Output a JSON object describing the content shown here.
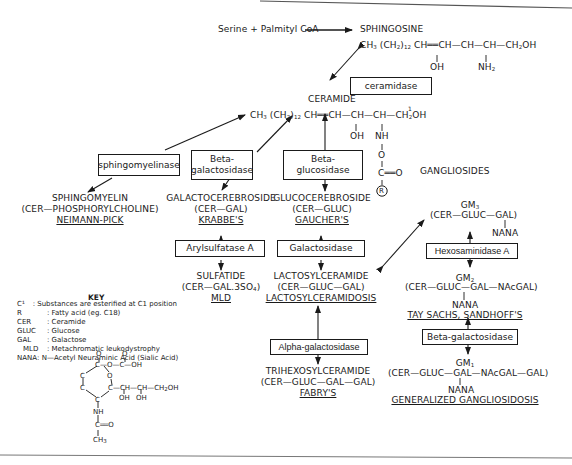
{
  "top": {
    "precursor": "Serine + Palmityl CoA",
    "sphingosine": "SPHINGOSINE",
    "sphingosine_formula": "CH₃ (CH₂)₁₂ CH══CH—CH—CH—CH₂OH",
    "sphingosine_oh": "OH",
    "sphingosine_nh2": "NH₂"
  },
  "ceramide": {
    "label": "CERAMIDE",
    "formula": "CH₃ (CH₂)₁₂ CH══CH—CH—CH—CH₂OH",
    "oh": "OH",
    "nh": "NH",
    "o": "O",
    "co": "C══O",
    "r": "R",
    "c1_mark": "1"
  },
  "enzymes": {
    "ceramidase": "ceramidase",
    "sphingomyelinase": "sphingomyelinase",
    "beta_galactosidase_1": "Beta-\ngalactosidase",
    "beta_glucosidase": "Beta-\nglucosidase",
    "arylsulfatase": "Arylsulfatase A",
    "galactosidase": "Galactosidase",
    "alpha_galactosidase": "Alpha-galactosidase",
    "hexosaminidase": "Hexosaminidase A",
    "beta_galactosidase_2": "Beta-galactosidase"
  },
  "compounds": {
    "sphingomyelin": {
      "name": "SPHINGOMYELIN",
      "formula": "(CER—PHOSPHORYLCHOLINE)",
      "disease": "NEIMANN-PICK"
    },
    "galactocerebroside": {
      "name": "GALACTOCEREBROSIDE",
      "formula": "(CER—GAL)",
      "disease": "KRABBE'S"
    },
    "glucocerebroside": {
      "name": "GLUCOCEREBROSIDE",
      "formula": "(CER—GLUC)",
      "disease": "GAUCHER'S"
    },
    "sulfatide": {
      "name": "SULFATIDE",
      "formula": "(CER—GAL.3SO₄)",
      "disease": "MLD"
    },
    "lactosylceramide": {
      "name": "LACTOSYLCERAMIDE",
      "formula": "(CER—GLUC—GAL)",
      "disease": "LACTOSYLCERAMIDOSIS"
    },
    "trihexosylceramide": {
      "name": "TRIHEXOSYLCERAMIDE",
      "formula": "(CER—GLUC—GAL—GAL)",
      "disease": "FABRY'S"
    }
  },
  "gangliosides": {
    "heading": "GANGLIOSIDES",
    "gm3": {
      "name": "GM₃",
      "formula": "(CER—GLUC—GAL)",
      "nana": "NANA"
    },
    "gm2": {
      "name": "GM₂",
      "formula": "(CER—GLUC—GAL—NAcGAL)",
      "nana": "NANA",
      "disease": "TAY SACHS, SANDHOFF'S"
    },
    "gm1": {
      "name": "GM₁",
      "formula": "(CER—GLUC—GAL—NAcGAL—GAL)",
      "nana": "NANA",
      "disease": "GENERALIZED GANGLIOSIDOSIS"
    }
  },
  "key": {
    "title": "KEY",
    "entries": [
      {
        "abbr": "C¹",
        "desc": ": Substances are esterified at C1 position"
      },
      {
        "abbr": "R",
        "desc": ": Fatty acid (eg. C18)"
      },
      {
        "abbr": "CER",
        "desc": ": Ceramide"
      },
      {
        "abbr": "GLUC",
        "desc": ": Glucose"
      },
      {
        "abbr": "GAL",
        "desc": ": Galactose"
      },
      {
        "abbr": "MLD",
        "desc": ": Metachromatic leukodystrophy"
      },
      {
        "abbr": "NANA",
        "desc": ": N—Acetyl Neuraminic Acid (Sialic Acid)"
      }
    ],
    "structure": {
      "o_top": "O",
      "o_ring": "O",
      "cooh": "—O—C—OH",
      "c_o": "O",
      "side_chain": "C—CH—CH—CH₂OH",
      "oh1": "OH",
      "oh2": "OH",
      "nh": "NH",
      "co": "C══O",
      "ch3": "CH₃"
    }
  }
}
